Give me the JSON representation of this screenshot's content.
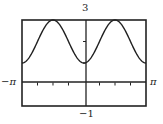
{
  "chart_data": {
    "type": "line",
    "title": "",
    "function": "y = 2 - cos(2x)",
    "xlabel": "",
    "ylabel": "",
    "xlim": [
      "-π",
      "π"
    ],
    "ylim": [
      -1,
      3
    ],
    "xlim_numeric": [
      -3.14159,
      3.14159
    ],
    "x_tick_step": "π/4",
    "y_tick_step": 1,
    "grid": false,
    "legend": null,
    "labels": {
      "x_min": "−π",
      "x_max": "π",
      "y_max": "3",
      "y_min": "−1"
    },
    "series": [
      {
        "name": "curve",
        "x": [
          -3.1416,
          -2.3562,
          -1.5708,
          -0.7854,
          0,
          0.7854,
          1.5708,
          2.3562,
          3.1416
        ],
        "y": [
          1,
          2,
          3,
          2,
          1,
          2,
          3,
          2,
          1
        ]
      }
    ],
    "color": "#222222"
  }
}
